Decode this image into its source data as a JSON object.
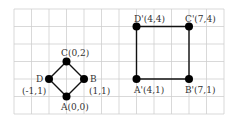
{
  "diagram": {
    "grid": {
      "cols": 12,
      "rows": 6,
      "origin_px": [
        66,
        96
      ],
      "unit_px": 17.5,
      "x0_px": 14,
      "y0_px": 9,
      "color": "#cccccc"
    },
    "shapes": [
      {
        "name": "square-ABCD",
        "vertices": [
          {
            "id": "A",
            "label": "A(0,0)",
            "x": 0,
            "y": 0
          },
          {
            "id": "B",
            "label": "(1,1)",
            "name_label": "B",
            "x": 1,
            "y": 1
          },
          {
            "id": "C",
            "label": "C(0,2)",
            "x": 0,
            "y": 2
          },
          {
            "id": "D",
            "label": "(-1,1)",
            "name_label": "D",
            "x": -1,
            "y": 1
          }
        ]
      },
      {
        "name": "square-A'B'C'D'",
        "vertices": [
          {
            "id": "A'",
            "label": "A'(4,1)",
            "x": 4,
            "y": 1
          },
          {
            "id": "B'",
            "label": "B'(7,1)",
            "x": 7,
            "y": 1
          },
          {
            "id": "C'",
            "label": "C'(7,4)",
            "x": 7,
            "y": 4
          },
          {
            "id": "D'",
            "label": "D'(4,4)",
            "x": 4,
            "y": 4
          }
        ]
      }
    ],
    "labels": {
      "A": "A(0,0)",
      "B_name": "B",
      "B_coord": "(1,1)",
      "C": "C(0,2)",
      "D_name": "D",
      "D_coord": "(-1,1)",
      "Ap": "A'(4,1)",
      "Bp": "B'(7,1)",
      "Cp": "C'(7,4)",
      "Dp": "D'(4,4)"
    }
  }
}
